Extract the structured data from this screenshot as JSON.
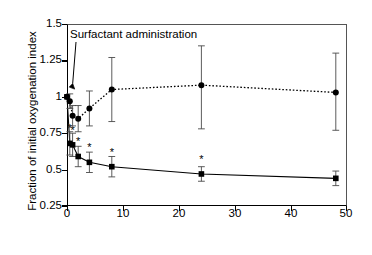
{
  "figure": {
    "ylabel": "Fraction of initial oxygenation index",
    "xlabel": "",
    "annotation": "Surfactant administration"
  },
  "axes": {
    "y_ticks": [
      "0.25",
      "0.5",
      "0.75",
      "1",
      "1.25",
      "1.5"
    ],
    "x_ticks": [
      "0",
      "10",
      "20",
      "30",
      "40",
      "50"
    ]
  },
  "chart_data": {
    "type": "line",
    "title": "",
    "xlabel": "",
    "ylabel": "Fraction of initial oxygenation index",
    "xlim": [
      0,
      50
    ],
    "ylim": [
      0.25,
      1.5
    ],
    "grid": false,
    "legend": "none",
    "annotations": [
      {
        "text": "Surfactant administration",
        "x": 0.3,
        "y": 1.42,
        "arrow_to_x": 0.3,
        "arrow_to_y": 1.05
      }
    ],
    "significance_marker": "*",
    "series": [
      {
        "name": "Oxygenation index (solid, filled squares)",
        "style": "solid",
        "marker": "square",
        "x": [
          0,
          0.5,
          1,
          2,
          4,
          8,
          24,
          48
        ],
        "values": [
          1.0,
          0.68,
          0.67,
          0.59,
          0.55,
          0.52,
          0.47,
          0.44
        ],
        "err_low": [
          0.0,
          0.08,
          0.08,
          0.07,
          0.07,
          0.07,
          0.05,
          0.05
        ],
        "err_high": [
          0.0,
          0.08,
          0.08,
          0.07,
          0.07,
          0.07,
          0.05,
          0.05
        ],
        "significant": [
          false,
          true,
          true,
          true,
          true,
          true,
          true,
          false
        ]
      },
      {
        "name": "Comparison index (dotted, filled circles)",
        "style": "dotted",
        "marker": "circle",
        "x": [
          0,
          0.5,
          1,
          2,
          4,
          8,
          24,
          48
        ],
        "values": [
          1.0,
          0.97,
          0.87,
          0.85,
          0.92,
          1.05,
          1.08,
          1.03
        ],
        "err_low": [
          0.0,
          0.05,
          0.07,
          0.09,
          0.12,
          0.22,
          0.3,
          0.26
        ],
        "err_high": [
          0.0,
          0.05,
          0.07,
          0.09,
          0.12,
          0.22,
          0.27,
          0.27
        ],
        "significant": [
          false,
          false,
          false,
          false,
          false,
          false,
          false,
          false
        ]
      }
    ]
  }
}
